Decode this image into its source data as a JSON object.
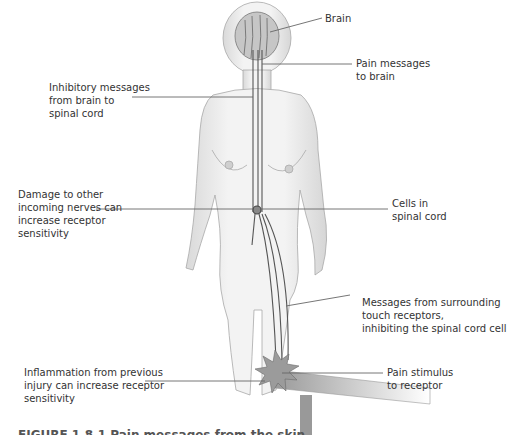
{
  "diagram": {
    "type": "anatomical-illustration",
    "labels": {
      "brain": "Brain",
      "pain_messages": [
        "Pain messages",
        "to brain"
      ],
      "inhibitory": [
        "Inhibitory messages",
        "from brain to",
        "spinal cord"
      ],
      "damage": [
        "Damage to other",
        "incoming nerves can",
        "increase receptor",
        "sensitivity"
      ],
      "cells": [
        "Cells in",
        "spinal cord"
      ],
      "touch": [
        "Messages from surrounding",
        "touch receptors,",
        "inhibiting the spinal cord cell"
      ],
      "inflammation": [
        "Inflammation from previous",
        "injury can increase receptor",
        "sensitivity"
      ],
      "stimulus": [
        "Pain stimulus",
        "to receptor"
      ]
    },
    "caption_fragment": "FIGURE 1.8.1  Pain messages from the skin ..."
  },
  "colors": {
    "body_fill": "#efefef",
    "body_shade": "#c8c8c8",
    "outline": "#9a9a9a",
    "nerve": "#555555",
    "leader": "#666666",
    "brain": "#bdbdbd",
    "text": "#333333"
  }
}
